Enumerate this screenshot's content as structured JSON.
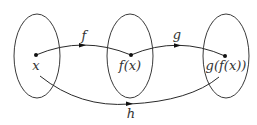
{
  "diagram": {
    "sets": [
      {
        "id": "domain-x",
        "point_label": "x"
      },
      {
        "id": "codomain-f",
        "point_label": "f(x)"
      },
      {
        "id": "codomain-g",
        "point_label": "g(f(x))"
      }
    ],
    "maps": [
      {
        "id": "f",
        "label": "f",
        "from": "x",
        "to": "f(x)"
      },
      {
        "id": "g",
        "label": "g",
        "from": "f(x)",
        "to": "g(f(x))"
      },
      {
        "id": "h",
        "label": "h",
        "from": "x",
        "to": "g(f(x))"
      }
    ]
  }
}
